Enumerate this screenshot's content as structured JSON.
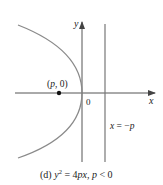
{
  "figure": {
    "caption_prefix": "(d)",
    "caption_eq_y": "y",
    "caption_eq_exp": "2",
    "caption_eq_rest": " = 4",
    "caption_eq_px": "px",
    "caption_comma": ", ",
    "caption_p": "p",
    "caption_cond": " < 0",
    "axis_x_label": "x",
    "axis_y_label": "y",
    "origin_label": "0",
    "focus_label_open": "(",
    "focus_label_p": "p",
    "focus_label_rest": ", 0)",
    "directrix_label_x": "x",
    "directrix_label_eq": " = −",
    "directrix_label_p": "p"
  },
  "colors": {
    "curve": "#8a8a8a",
    "axes": "#555555",
    "directrix": "#777777",
    "point": "#111111",
    "text": "#222222"
  }
}
